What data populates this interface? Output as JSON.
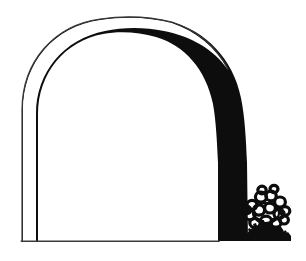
{
  "artwork": {
    "title": "Arch Outline with Shrub",
    "type": "line-drawing",
    "description": "Black and white line drawing of a tall rounded arch. The contour is a hairline on the left and across the top-left, then swells into a heavy solid black band down the right side. A thin baseline closes the bottom, and a dense black shrub sits at the lower right against the band.",
    "canvas": {
      "width": 306,
      "height": 261,
      "background_color": "#ffffff"
    },
    "ink_color": "#0d0d0d",
    "hairline_color": "#3a3a3a",
    "shapes": [
      {
        "name": "arch-contour",
        "label": "Arch contour",
        "stroke_min_px": 1,
        "stroke_max_px": 30,
        "apex_y": 19,
        "left_edge_x": 22,
        "right_edge_x": 248,
        "baseline_y": 241
      },
      {
        "name": "baseline",
        "label": "Ground line",
        "x_start": 22,
        "x_end": 218,
        "y": 241,
        "stroke_px": 1
      },
      {
        "name": "ground-shadow",
        "label": "Ground shadow strip",
        "x_start": 218,
        "x_end": 290,
        "y": 232,
        "height_px": 9
      },
      {
        "name": "shrub",
        "label": "Shrub",
        "center_x": 266,
        "center_y": 212,
        "width_px": 44,
        "height_px": 46
      }
    ]
  }
}
